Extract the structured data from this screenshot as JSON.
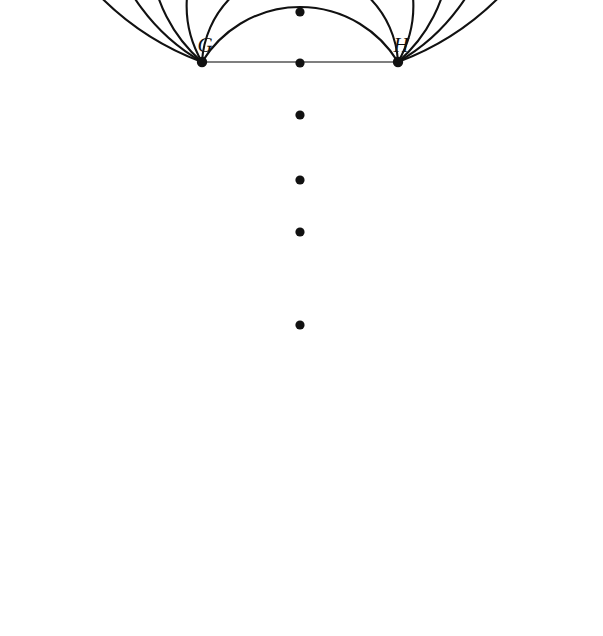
{
  "figure": {
    "background_color": "#ffffff",
    "stroke_color": "#111111",
    "chord_color": "#555555",
    "width": 603,
    "height": 636
  },
  "labels": {
    "left_point": "G",
    "right_point": "H",
    "left_point_x": 205,
    "left_point_y": 52,
    "right_point_x": 401,
    "right_point_y": 52
  },
  "chart_data": {
    "type": "scatter",
    "xlabel": "",
    "ylabel": "",
    "xlim": [
      0,
      603
    ],
    "ylim": [
      636,
      0
    ],
    "grid": false,
    "legend": "none",
    "base_points": [
      {
        "name": "G",
        "x": 202,
        "y": 62,
        "radius": 5.2
      },
      {
        "name": "H",
        "x": 398,
        "y": 62,
        "radius": 5.2
      }
    ],
    "chord": {
      "x1": 202,
      "y1": 62,
      "x2": 398,
      "y2": 62
    },
    "center_dots": [
      {
        "id": "d0",
        "x": 300,
        "y": 12,
        "radius": 4.6,
        "on_arc": false
      },
      {
        "id": "d1",
        "x": 300,
        "y": 63,
        "radius": 4.6,
        "on_arc": true
      },
      {
        "id": "d2",
        "x": 300,
        "y": 115,
        "radius": 4.6,
        "on_arc": true
      },
      {
        "id": "d3",
        "x": 300,
        "y": 180,
        "radius": 4.6,
        "on_arc": false
      },
      {
        "id": "d4",
        "x": 300,
        "y": 232,
        "radius": 4.6,
        "on_arc": true
      },
      {
        "id": "d5",
        "x": 300,
        "y": 325,
        "radius": 4.6,
        "on_arc": true
      }
    ],
    "arcs": [
      {
        "id": "a1",
        "sagitta": 55,
        "bottom_y": 117,
        "label": "arc-1"
      },
      {
        "id": "a2",
        "sagitta": 93,
        "bottom_y": 155,
        "label": "arc-2"
      },
      {
        "id": "a3",
        "sagitta": 170,
        "bottom_y": 232,
        "label": "arc-3"
      },
      {
        "id": "a4",
        "sagitta": 263,
        "bottom_y": 325,
        "label": "arc-4"
      },
      {
        "id": "a5",
        "sagitta": 368,
        "bottom_y": 430,
        "label": "arc-5"
      },
      {
        "id": "a6",
        "sagitta": 546,
        "bottom_y": 608,
        "label": "arc-6"
      }
    ]
  }
}
